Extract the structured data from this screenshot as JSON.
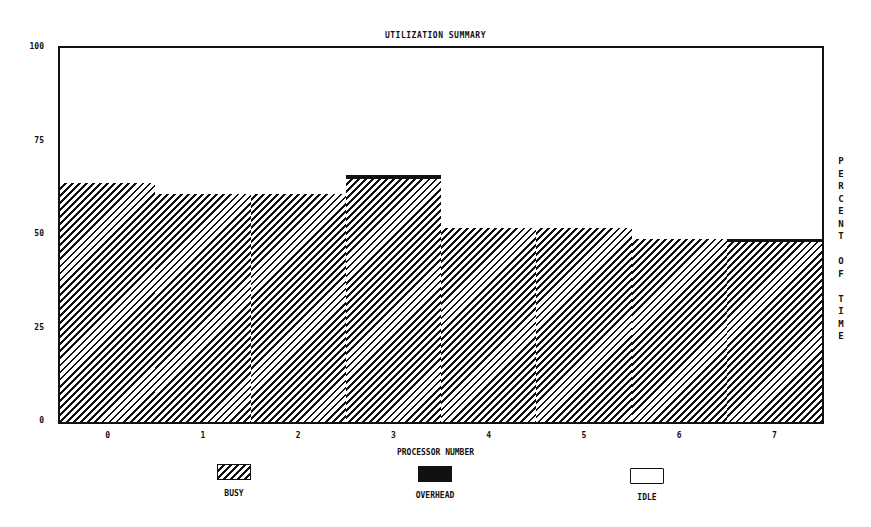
{
  "chart_data": {
    "type": "bar",
    "title": "UTILIZATION SUMMARY",
    "xlabel": "PROCESSOR NUMBER",
    "ylabel": "PERCENT OF TIME",
    "ylim": [
      0,
      100
    ],
    "yticks": [
      "0",
      "25",
      "50",
      "75",
      "100"
    ],
    "categories": [
      "0",
      "1",
      "2",
      "3",
      "4",
      "5",
      "6",
      "7"
    ],
    "stacked": true,
    "series": [
      {
        "name": "BUSY",
        "pattern": "diagonal-hatch",
        "values": [
          64,
          61,
          61,
          65,
          52,
          52,
          49,
          48
        ]
      },
      {
        "name": "OVERHEAD",
        "pattern": "solid-black",
        "values": [
          0,
          0,
          0,
          1,
          0,
          0,
          0,
          1
        ]
      },
      {
        "name": "IDLE",
        "pattern": "white",
        "values": [
          36,
          39,
          39,
          34,
          48,
          48,
          51,
          51
        ]
      }
    ],
    "grid": false,
    "legend_position": "bottom",
    "legend": [
      "BUSY",
      "OVERHEAD",
      "IDLE"
    ]
  },
  "labels": {
    "title": "UTILIZATION SUMMARY",
    "xlabel": "PROCESSOR NUMBER",
    "ylabel_letters": [
      "P",
      "E",
      "R",
      "C",
      "E",
      "N",
      "T",
      "",
      "O",
      "F",
      "",
      "T",
      "I",
      "M",
      "E"
    ],
    "legend_busy": "BUSY",
    "legend_overhead": "OVERHEAD",
    "legend_idle": "IDLE"
  },
  "colors": {
    "ink": "#111111",
    "background": "#ffffff"
  }
}
